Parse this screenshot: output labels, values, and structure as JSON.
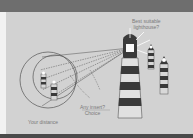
{
  "diagram": {
    "labels": {
      "best_lighthouse_line1": "Best suitable",
      "best_lighthouse_line2": "lighthouse?",
      "insert_line1": "Any insert?",
      "insert_line2": "Choice",
      "distance": "Your distance"
    },
    "elements": {
      "main_lighthouse": "large striped lighthouse emitting beam",
      "beam": "cone of light toward circles",
      "circles": "two nested circles containing small lighthouses",
      "small_lighthouses_in_circle": 2,
      "distant_lighthouses": 2
    },
    "colors": {
      "panel": "#d2d2d2",
      "stripe_dark": "#3a3a3a",
      "stripe_light": "#e0e0e0",
      "outline": "#555555",
      "top_bar": "#6e6e6e"
    }
  }
}
